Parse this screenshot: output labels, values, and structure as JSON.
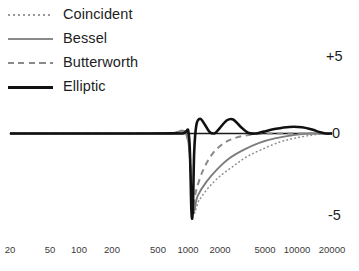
{
  "chart_data": {
    "type": "line",
    "title": "",
    "xlabel": "",
    "ylabel": "",
    "xscale": "log",
    "xlim": [
      20,
      20000
    ],
    "ylim": [
      -5,
      5
    ],
    "grid": false,
    "legend_position": "top-left",
    "xticks": [
      {
        "value": 20,
        "label": "20",
        "px": 10
      },
      {
        "value": 50,
        "label": "50",
        "px": 50
      },
      {
        "value": 100,
        "label": "100",
        "px": 79
      },
      {
        "value": 200,
        "label": "200",
        "px": 112
      },
      {
        "value": 500,
        "label": "500",
        "px": 158
      },
      {
        "value": 1000,
        "label": "1000",
        "px": 188
      },
      {
        "value": 2000,
        "label": "2000",
        "px": 220
      },
      {
        "value": 5000,
        "label": "5000",
        "px": 265
      },
      {
        "value": 10000,
        "label": "10000",
        "px": 297
      },
      {
        "value": 20000,
        "label": "20000",
        "px": 332
      }
    ],
    "yticks": [
      {
        "value": 5,
        "label": "+5"
      },
      {
        "value": 0,
        "label": "0"
      },
      {
        "value": -5,
        "label": "-5"
      }
    ],
    "series": [
      {
        "name": "Coincident",
        "style": "dotted",
        "color": "#8e8e8e",
        "width": 1.6,
        "points": [
          {
            "x": 20,
            "y": 0.0
          },
          {
            "x": 200,
            "y": 0.0
          },
          {
            "x": 600,
            "y": 0.0
          },
          {
            "x": 900,
            "y": -0.2
          },
          {
            "x": 1000,
            "y": -4.95
          },
          {
            "x": 1150,
            "y": -4.3
          },
          {
            "x": 1400,
            "y": -3.5
          },
          {
            "x": 1800,
            "y": -2.75
          },
          {
            "x": 2400,
            "y": -2.1
          },
          {
            "x": 3200,
            "y": -1.5
          },
          {
            "x": 4500,
            "y": -1.0
          },
          {
            "x": 6500,
            "y": -0.55
          },
          {
            "x": 9000,
            "y": -0.3
          },
          {
            "x": 13000,
            "y": -0.1
          },
          {
            "x": 17000,
            "y": -0.02
          },
          {
            "x": 20000,
            "y": 0.0
          }
        ]
      },
      {
        "name": "Bessel",
        "style": "solid",
        "color": "#7d7d7d",
        "width": 1.9,
        "points": [
          {
            "x": 20,
            "y": 0.0
          },
          {
            "x": 200,
            "y": 0.0
          },
          {
            "x": 600,
            "y": 0.0
          },
          {
            "x": 900,
            "y": -0.25
          },
          {
            "x": 1000,
            "y": -4.95
          },
          {
            "x": 1120,
            "y": -4.0
          },
          {
            "x": 1350,
            "y": -3.1
          },
          {
            "x": 1700,
            "y": -2.3
          },
          {
            "x": 2200,
            "y": -1.6
          },
          {
            "x": 3000,
            "y": -1.05
          },
          {
            "x": 4200,
            "y": -0.6
          },
          {
            "x": 6000,
            "y": -0.3
          },
          {
            "x": 8500,
            "y": -0.12
          },
          {
            "x": 12000,
            "y": 0.0
          },
          {
            "x": 20000,
            "y": 0.0
          }
        ]
      },
      {
        "name": "Butterworth",
        "style": "dashed",
        "color": "#8a8a8a",
        "width": 2.0,
        "points": [
          {
            "x": 20,
            "y": 0.0
          },
          {
            "x": 200,
            "y": 0.0
          },
          {
            "x": 600,
            "y": 0.0
          },
          {
            "x": 900,
            "y": -0.3
          },
          {
            "x": 1000,
            "y": -4.9
          },
          {
            "x": 1080,
            "y": -3.7
          },
          {
            "x": 1250,
            "y": -2.4
          },
          {
            "x": 1500,
            "y": -1.4
          },
          {
            "x": 1850,
            "y": -0.75
          },
          {
            "x": 2300,
            "y": -0.38
          },
          {
            "x": 3000,
            "y": -0.15
          },
          {
            "x": 4000,
            "y": -0.04
          },
          {
            "x": 5500,
            "y": 0.0
          },
          {
            "x": 20000,
            "y": 0.0
          }
        ]
      },
      {
        "name": "Elliptic",
        "style": "solid",
        "color": "#111111",
        "width": 2.6,
        "points": [
          {
            "x": 20,
            "y": 0.0
          },
          {
            "x": 400,
            "y": 0.0
          },
          {
            "x": 800,
            "y": 0.0
          },
          {
            "x": 930,
            "y": -0.15
          },
          {
            "x": 980,
            "y": -4.95
          },
          {
            "x": 1010,
            "y": -4.9
          },
          {
            "x": 1040,
            "y": -1.2
          },
          {
            "x": 1090,
            "y": 0.55
          },
          {
            "x": 1180,
            "y": 0.95
          },
          {
            "x": 1300,
            "y": 0.6
          },
          {
            "x": 1450,
            "y": 0.1
          },
          {
            "x": 1620,
            "y": 0.02
          },
          {
            "x": 1800,
            "y": 0.35
          },
          {
            "x": 2100,
            "y": 0.85
          },
          {
            "x": 2400,
            "y": 0.9
          },
          {
            "x": 2800,
            "y": 0.45
          },
          {
            "x": 3300,
            "y": 0.05
          },
          {
            "x": 3900,
            "y": 0.0
          },
          {
            "x": 4600,
            "y": 0.12
          },
          {
            "x": 6000,
            "y": 0.3
          },
          {
            "x": 8000,
            "y": 0.42
          },
          {
            "x": 10500,
            "y": 0.4
          },
          {
            "x": 13000,
            "y": 0.25
          },
          {
            "x": 15500,
            "y": 0.08
          },
          {
            "x": 17500,
            "y": 0.0
          },
          {
            "x": 20000,
            "y": 0.0
          }
        ]
      }
    ],
    "zero_line": {
      "color": "#1a1a1a",
      "width": 1.4,
      "x_start": 20,
      "x_end": 18000
    }
  },
  "legend": {
    "items": [
      {
        "label": "Coincident",
        "style": "dotted"
      },
      {
        "label": "Bessel",
        "style": "solid"
      },
      {
        "label": "Butterworth",
        "style": "dashed"
      },
      {
        "label": "Elliptic",
        "style": "solid-thick"
      }
    ]
  }
}
